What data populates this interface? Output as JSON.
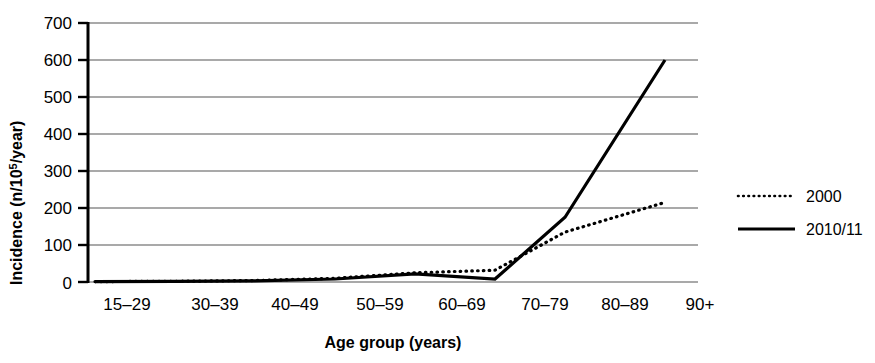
{
  "chart_data": {
    "type": "line",
    "title": "",
    "xlabel": "Age group (years)",
    "ylabel": "Incidence (n/10",
    "ylabel_sup": "5",
    "ylabel_tail": "/year)",
    "categories": [
      "15–29",
      "30–39",
      "40–49",
      "50–59",
      "60–69",
      "70–79",
      "80–89",
      "90+"
    ],
    "series": [
      {
        "name": "2000",
        "style": "dotted",
        "color": "#000000",
        "values": [
          1,
          2,
          4,
          10,
          25,
          32,
          135,
          215
        ]
      },
      {
        "name": "2010/11",
        "style": "solid",
        "color": "#000000",
        "values": [
          1,
          2,
          3,
          8,
          22,
          8,
          175,
          600
        ]
      }
    ],
    "ylim": [
      0,
      700
    ],
    "ytick_values": [
      0,
      100,
      200,
      300,
      400,
      500,
      600,
      700
    ],
    "ytick_labels": [
      "0",
      "100",
      "200",
      "300",
      "400",
      "500",
      "600",
      "700"
    ],
    "grid": true,
    "grid_axis": "y",
    "legend_position": "right"
  },
  "legend": {
    "entries": [
      {
        "label": "2000",
        "style": "dotted"
      },
      {
        "label": "2010/11",
        "style": "solid"
      }
    ]
  },
  "colors": {
    "line": "#000000",
    "grid": "#8c8c8c",
    "axis": "#000000",
    "background": "#ffffff"
  }
}
